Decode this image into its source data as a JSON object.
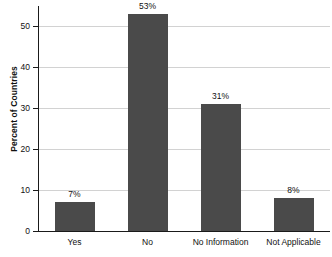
{
  "chart_data": {
    "type": "bar",
    "title": "",
    "xlabel": "",
    "ylabel": "Percent of Countries",
    "categories": [
      "Yes",
      "No",
      "No Information",
      "Not Applicable"
    ],
    "values": [
      7,
      53,
      31,
      8
    ],
    "data_labels": [
      "7%",
      "53%",
      "31%",
      "8%"
    ],
    "ylim": [
      0,
      55
    ],
    "yticks": [
      0,
      10,
      20,
      30,
      40,
      50
    ],
    "ytick_labels": [
      "0",
      "10",
      "20",
      "30",
      "40",
      "50"
    ],
    "grid": "horizontal",
    "legend": "none",
    "bar_color": "#4a4a4a",
    "grid_color": "#d2d2d2",
    "axis_color": "#1a1a1a",
    "background_color": "#ffffff"
  }
}
